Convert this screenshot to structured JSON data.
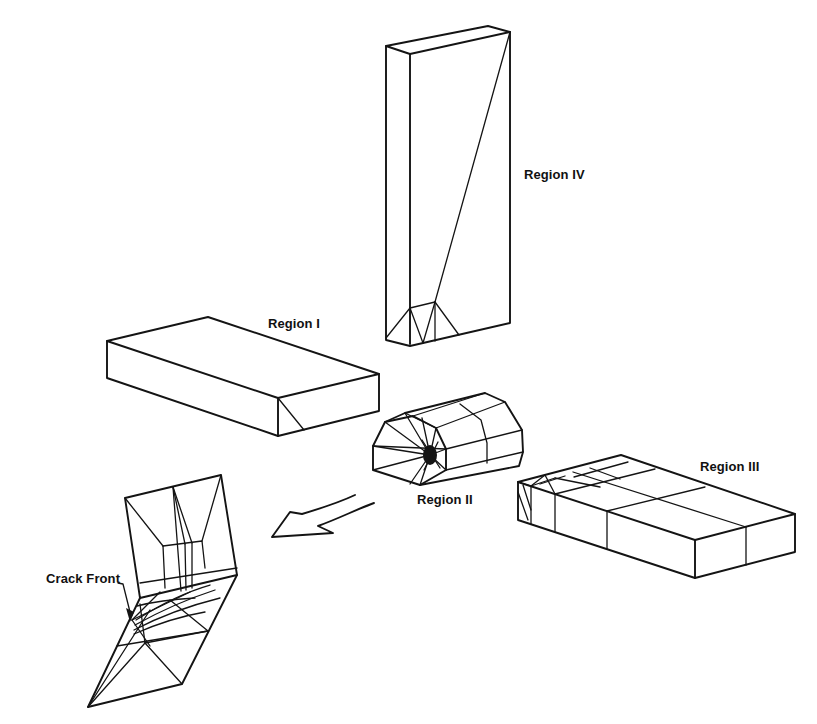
{
  "figure": {
    "regions": [
      {
        "id": "region-iv",
        "label": "Region IV"
      },
      {
        "id": "region-i",
        "label": "Region I"
      },
      {
        "id": "region-ii",
        "label": "Region II"
      },
      {
        "id": "region-iii",
        "label": "Region III"
      }
    ],
    "annotations": {
      "crack_front": "Crack Front"
    },
    "colors": {
      "line": "#141414",
      "background": "#ffffff"
    }
  }
}
